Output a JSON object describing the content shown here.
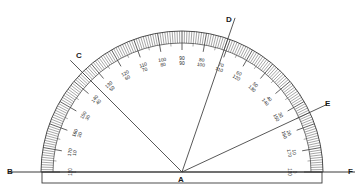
{
  "figure": {
    "type": "protractor-diagram",
    "background_color": "#ffffff",
    "ink_color": "#3a3a3a",
    "label_color": "#1a1a1a"
  },
  "geometry": {
    "center": {
      "x": 182,
      "y": 172
    },
    "outer_radius": 141,
    "inner_radius": 129,
    "tick_base_radius": 122,
    "label_radius": 111,
    "baseline": {
      "x1": 8,
      "y1": 172,
      "x2": 355,
      "y2": 172
    },
    "body_rect": {
      "x": 42,
      "y": 172,
      "width": 280,
      "height": 11
    }
  },
  "points": [
    {
      "name": "B",
      "label": "B",
      "x": 7,
      "y": 168,
      "kind": "baseline-endpoint-left"
    },
    {
      "name": "C",
      "label": "C",
      "x": 76,
      "y": 52,
      "kind": "ray-endpoint"
    },
    {
      "name": "D",
      "label": "D",
      "x": 226,
      "y": 16,
      "kind": "ray-endpoint"
    },
    {
      "name": "E",
      "label": "E",
      "x": 325,
      "y": 100,
      "kind": "ray-endpoint"
    },
    {
      "name": "F",
      "label": "F",
      "x": 348,
      "y": 168,
      "kind": "baseline-endpoint-right"
    },
    {
      "name": "A",
      "label": "A",
      "x": 178,
      "y": 176,
      "kind": "vertex"
    }
  ],
  "rays": [
    {
      "name": "ray-AC",
      "from": "A",
      "to": "C",
      "angle_deg": 135,
      "length": 158,
      "reading_outer": 135,
      "reading_inner": 45
    },
    {
      "name": "ray-AD",
      "from": "A",
      "to": "D",
      "angle_deg": 71,
      "length": 163,
      "reading_outer": 71,
      "reading_inner": 109
    },
    {
      "name": "ray-AE",
      "from": "A",
      "to": "E",
      "angle_deg": 25,
      "length": 160,
      "reading_outer": 25,
      "reading_inner": 155
    }
  ],
  "scale": {
    "outer_start": 0,
    "outer_end": 180,
    "minor_step": 1,
    "medium_step": 5,
    "major_step": 10,
    "label_step": 10,
    "numbering": "double",
    "labels": [
      {
        "outer": 0,
        "inner": 180,
        "top_text": "0",
        "bottom_text": "180"
      },
      {
        "outer": 10,
        "inner": 170,
        "top_text": "10",
        "bottom_text": "170"
      },
      {
        "outer": 20,
        "inner": 160,
        "top_text": "20",
        "bottom_text": "160"
      },
      {
        "outer": 30,
        "inner": 150,
        "top_text": "30",
        "bottom_text": "150"
      },
      {
        "outer": 40,
        "inner": 140,
        "top_text": "40",
        "bottom_text": "140"
      },
      {
        "outer": 50,
        "inner": 130,
        "top_text": "50",
        "bottom_text": "130"
      },
      {
        "outer": 60,
        "inner": 120,
        "top_text": "60",
        "bottom_text": "120"
      },
      {
        "outer": 70,
        "inner": 110,
        "top_text": "70",
        "bottom_text": "110"
      },
      {
        "outer": 80,
        "inner": 100,
        "top_text": "80",
        "bottom_text": "100"
      },
      {
        "outer": 90,
        "inner": 90,
        "top_text": "90",
        "bottom_text": "90"
      },
      {
        "outer": 100,
        "inner": 80,
        "top_text": "100",
        "bottom_text": "80"
      },
      {
        "outer": 110,
        "inner": 70,
        "top_text": "110",
        "bottom_text": "70"
      },
      {
        "outer": 120,
        "inner": 60,
        "top_text": "120",
        "bottom_text": "60"
      },
      {
        "outer": 130,
        "inner": 50,
        "top_text": "130",
        "bottom_text": "50"
      },
      {
        "outer": 140,
        "inner": 40,
        "top_text": "140",
        "bottom_text": "40"
      },
      {
        "outer": 150,
        "inner": 30,
        "top_text": "150",
        "bottom_text": "30"
      },
      {
        "outer": 160,
        "inner": 20,
        "top_text": "160",
        "bottom_text": "20"
      },
      {
        "outer": 170,
        "inner": 10,
        "top_text": "170",
        "bottom_text": "10"
      },
      {
        "outer": 180,
        "inner": 0,
        "top_text": "180",
        "bottom_text": "0"
      }
    ]
  }
}
